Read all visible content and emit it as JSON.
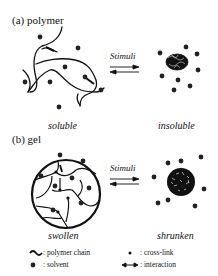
{
  "panels": [
    {
      "id": "a",
      "title": "(a) polymer",
      "arrow_label": "Stimuli",
      "left_state": "soluble",
      "right_state": "insoluble"
    },
    {
      "id": "b",
      "title": "(b) gel",
      "arrow_label": "Stimuli",
      "left_state": "swollen",
      "right_state": "shrunken"
    }
  ],
  "legend": [
    {
      "icon": "polymer-chain-icon",
      "separator": ":",
      "label": "polymer chain"
    },
    {
      "icon": "cross-link-icon",
      "separator": ":",
      "label": "cross-link"
    },
    {
      "icon": "solvent-icon",
      "separator": ":",
      "label": "solvent"
    },
    {
      "icon": "interaction-icon",
      "separator": ":",
      "label": "interaction"
    }
  ]
}
